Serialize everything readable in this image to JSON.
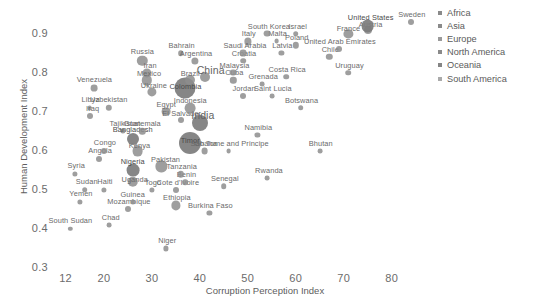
{
  "chart_data": {
    "type": "scatter",
    "title": "",
    "xlabel": "Corruption Perception Index",
    "ylabel": "Human Development Index",
    "xlim": [
      10,
      88
    ],
    "ylim": [
      0.3,
      0.95
    ],
    "xticks": [
      "12",
      "20",
      "30",
      "40",
      "50",
      "60",
      "70",
      "80"
    ],
    "xtick_values": [
      12,
      20,
      30,
      40,
      50,
      60,
      70,
      80
    ],
    "yticks": [
      "0.3",
      "0.4",
      "0.5",
      "0.6",
      "0.7",
      "0.8",
      "0.9"
    ],
    "ytick_values": [
      0.3,
      0.4,
      0.5,
      0.6,
      0.7,
      0.8,
      0.9
    ],
    "grid": false,
    "legend_position": "top-right",
    "legend": [
      {
        "label": "Africa",
        "color": "#8a8a8a"
      },
      {
        "label": "Asia",
        "color": "#8a8a8a"
      },
      {
        "label": "Europe",
        "color": "#9a9a9a"
      },
      {
        "label": "North America",
        "color": "#8a8a8a"
      },
      {
        "label": "Oceania",
        "color": "#858585"
      },
      {
        "label": "South America",
        "color": "#aaaaaa"
      }
    ],
    "size_encoding": "population",
    "points": [
      {
        "label": "South Sudan",
        "x": 13,
        "y": 0.4,
        "r": 2.2,
        "lx": 0,
        "ly": -9
      },
      {
        "label": "Syria",
        "x": 14,
        "y": 0.54,
        "r": 2.6,
        "lx": 1,
        "ly": -9
      },
      {
        "label": "Yemen",
        "x": 15,
        "y": 0.47,
        "r": 2.6,
        "lx": 1,
        "ly": -9
      },
      {
        "label": "Libya",
        "x": 17,
        "y": 0.71,
        "r": 2.4,
        "lx": 1,
        "ly": -9
      },
      {
        "label": "Iraq",
        "x": 17,
        "y": 0.69,
        "r": 3.0,
        "lx": 3,
        "ly": -8
      },
      {
        "label": "Sudan",
        "x": 16,
        "y": 0.5,
        "r": 2.8,
        "lx": 2,
        "ly": -9
      },
      {
        "label": "Venezuela",
        "x": 18,
        "y": 0.76,
        "r": 3.4,
        "lx": 0,
        "ly": -9
      },
      {
        "label": "Angola",
        "x": 19,
        "y": 0.58,
        "r": 3.0,
        "lx": 1,
        "ly": -9
      },
      {
        "label": "Congo",
        "x": 20,
        "y": 0.6,
        "r": 3.0,
        "lx": 1,
        "ly": -9
      },
      {
        "label": "Haiti",
        "x": 20,
        "y": 0.5,
        "r": 2.6,
        "lx": 1,
        "ly": -9
      },
      {
        "label": "Uzbekistan",
        "x": 21,
        "y": 0.71,
        "r": 3.2,
        "lx": 0,
        "ly": -9
      },
      {
        "label": "Tajikistan",
        "x": 24,
        "y": 0.65,
        "r": 2.6,
        "lx": 2,
        "ly": -8
      },
      {
        "label": "Chad",
        "x": 21,
        "y": 0.41,
        "r": 2.4,
        "lx": 2,
        "ly": -8
      },
      {
        "label": "Mozambique",
        "x": 25,
        "y": 0.45,
        "r": 3.0,
        "lx": 1,
        "ly": -8
      },
      {
        "label": "Guinea",
        "x": 26,
        "y": 0.47,
        "r": 2.6,
        "lx": 0,
        "ly": -8
      },
      {
        "label": "Uganda",
        "x": 26,
        "y": 0.52,
        "r": 5.2,
        "lx": 2,
        "ly": -3
      },
      {
        "label": "Nigeria",
        "x": 26,
        "y": 0.55,
        "r": 6.4,
        "lx": 0,
        "ly": -9
      },
      {
        "label": "Kenya",
        "x": 27,
        "y": 0.6,
        "r": 5.4,
        "lx": 2,
        "ly": -6
      },
      {
        "label": "Bangladesh",
        "x": 26,
        "y": 0.63,
        "r": 6.0,
        "lx": 0,
        "ly": -10
      },
      {
        "label": "Russia",
        "x": 28,
        "y": 0.83,
        "r": 5.2,
        "lx": 0,
        "ly": -10
      },
      {
        "label": "Iran",
        "x": 29,
        "y": 0.8,
        "r": 4.6,
        "lx": 3,
        "ly": -8
      },
      {
        "label": "Mexico",
        "x": 29,
        "y": 0.78,
        "r": 5.2,
        "lx": 2,
        "ly": -7
      },
      {
        "label": "Ukraine",
        "x": 30,
        "y": 0.75,
        "r": 4.6,
        "lx": 2,
        "ly": -7
      },
      {
        "label": "Guatemala",
        "x": 28,
        "y": 0.65,
        "r": 3.2,
        "lx": 0,
        "ly": -8
      },
      {
        "label": "Egypt",
        "x": 33,
        "y": 0.7,
        "r": 4.4,
        "lx": 0,
        "ly": -8
      },
      {
        "label": "Pakistan",
        "x": 32,
        "y": 0.56,
        "r": 5.6,
        "lx": 4,
        "ly": -7
      },
      {
        "label": "Togo",
        "x": 30,
        "y": 0.5,
        "r": 2.6,
        "lx": 1,
        "ly": -8
      },
      {
        "label": "Niger",
        "x": 33,
        "y": 0.35,
        "r": 2.6,
        "lx": 1,
        "ly": -8
      },
      {
        "label": "Ethiopia",
        "x": 35,
        "y": 0.46,
        "r": 4.6,
        "lx": 1,
        "ly": -8
      },
      {
        "label": "Cote d'Ivoire",
        "x": 35,
        "y": 0.5,
        "r": 3.0,
        "lx": 2,
        "ly": -8
      },
      {
        "label": "Benin",
        "x": 37,
        "y": 0.52,
        "r": 2.8,
        "lx": 1,
        "ly": -8
      },
      {
        "label": "Tanzania",
        "x": 36,
        "y": 0.54,
        "r": 3.2,
        "lx": 1,
        "ly": -8
      },
      {
        "label": "El Salvador",
        "x": 36,
        "y": 0.68,
        "r": 3.0,
        "lx": 1,
        "ly": -7
      },
      {
        "label": "India",
        "x": 40,
        "y": 0.67,
        "r": 8.0,
        "lx": 3,
        "ly": -10
      },
      {
        "label": "Timor",
        "x": 38,
        "y": 0.62,
        "r": 11.0,
        "lx": 0,
        "ly": -3
      },
      {
        "label": "Indonesia",
        "x": 38,
        "y": 0.71,
        "r": 5.4,
        "lx": 0,
        "ly": -8
      },
      {
        "label": "Colombia",
        "x": 37,
        "y": 0.76,
        "r": 10.5,
        "lx": 0,
        "ly": -2
      },
      {
        "label": "Brazil",
        "x": 38,
        "y": 0.78,
        "r": 5.0,
        "lx": 0,
        "ly": -7
      },
      {
        "label": "China",
        "x": 41,
        "y": 0.79,
        "r": 5.0,
        "lx": 6,
        "ly": -9
      },
      {
        "label": "Ghana",
        "x": 41,
        "y": 0.6,
        "r": 3.4,
        "lx": 1,
        "ly": -8
      },
      {
        "label": "Senegal",
        "x": 45,
        "y": 0.51,
        "r": 2.8,
        "lx": 1,
        "ly": -8
      },
      {
        "label": "Burkina Faso",
        "x": 42,
        "y": 0.44,
        "r": 2.6,
        "lx": 1,
        "ly": -8
      },
      {
        "label": "Rwanda",
        "x": 54,
        "y": 0.53,
        "r": 2.4,
        "lx": 2,
        "ly": -8
      },
      {
        "label": "Sao Tome and Principe",
        "x": 46,
        "y": 0.6,
        "r": 2.4,
        "lx": 1,
        "ly": -8
      },
      {
        "label": "Namibia",
        "x": 52,
        "y": 0.64,
        "r": 2.6,
        "lx": 1,
        "ly": -8
      },
      {
        "label": "Bhutan",
        "x": 65,
        "y": 0.6,
        "r": 2.4,
        "lx": 1,
        "ly": -8
      },
      {
        "label": "Botswana",
        "x": 61,
        "y": 0.71,
        "r": 2.8,
        "lx": 1,
        "ly": -8
      },
      {
        "label": "Saint Lucia",
        "x": 55,
        "y": 0.74,
        "r": 2.4,
        "lx": 1,
        "ly": -8
      },
      {
        "label": "Jordan",
        "x": 49,
        "y": 0.74,
        "r": 3.0,
        "lx": 1,
        "ly": -8
      },
      {
        "label": "Grenada",
        "x": 53,
        "y": 0.77,
        "r": 2.4,
        "lx": 1,
        "ly": -8
      },
      {
        "label": "Cuba",
        "x": 47,
        "y": 0.78,
        "r": 3.2,
        "lx": 1,
        "ly": -8
      },
      {
        "label": "Malaysia",
        "x": 47,
        "y": 0.8,
        "r": 3.4,
        "lx": 1,
        "ly": -8
      },
      {
        "label": "Croatia",
        "x": 49,
        "y": 0.83,
        "r": 2.8,
        "lx": 1,
        "ly": -8
      },
      {
        "label": "Italy",
        "x": 50,
        "y": 0.88,
        "r": 3.6,
        "lx": 1,
        "ly": -8
      },
      {
        "label": "Saudi Arabia",
        "x": 49,
        "y": 0.85,
        "r": 3.4,
        "lx": 2,
        "ly": -8
      },
      {
        "label": "Costa Rica",
        "x": 58,
        "y": 0.79,
        "r": 2.8,
        "lx": 1,
        "ly": -8
      },
      {
        "label": "Uruguay",
        "x": 71,
        "y": 0.8,
        "r": 2.8,
        "lx": 1,
        "ly": -8
      },
      {
        "label": "Chile",
        "x": 67,
        "y": 0.84,
        "r": 3.2,
        "lx": 1,
        "ly": -8
      },
      {
        "label": "Latvia",
        "x": 57,
        "y": 0.85,
        "r": 2.6,
        "lx": 1,
        "ly": -8
      },
      {
        "label": "Poland",
        "x": 60,
        "y": 0.87,
        "r": 3.2,
        "lx": 1,
        "ly": -8
      },
      {
        "label": "Malta",
        "x": 56,
        "y": 0.88,
        "r": 2.4,
        "lx": 1,
        "ly": -8
      },
      {
        "label": "South Korea",
        "x": 54,
        "y": 0.9,
        "r": 3.4,
        "lx": 2,
        "ly": -8
      },
      {
        "label": "Israel",
        "x": 60,
        "y": 0.9,
        "r": 2.8,
        "lx": 2,
        "ly": -8
      },
      {
        "label": "United Arab Emirates",
        "x": 69,
        "y": 0.86,
        "r": 3.0,
        "lx": 1,
        "ly": -8
      },
      {
        "label": "France",
        "x": 71,
        "y": 0.9,
        "r": 4.6,
        "lx": 0,
        "ly": -6
      },
      {
        "label": "Austria",
        "x": 75,
        "y": 0.91,
        "r": 4.0,
        "lx": 3,
        "ly": -6
      },
      {
        "label": "United States",
        "x": 75,
        "y": 0.92,
        "r": 6.4,
        "lx": 3,
        "ly": -9
      },
      {
        "label": "Sweden",
        "x": 84,
        "y": 0.93,
        "r": 3.0,
        "lx": 1,
        "ly": -8
      },
      {
        "label": "Bahrain",
        "x": 36,
        "y": 0.85,
        "r": 2.8,
        "lx": 1,
        "ly": -8
      },
      {
        "label": "Argentina",
        "x": 39,
        "y": 0.83,
        "r": 3.6,
        "lx": 1,
        "ly": -8
      }
    ]
  }
}
